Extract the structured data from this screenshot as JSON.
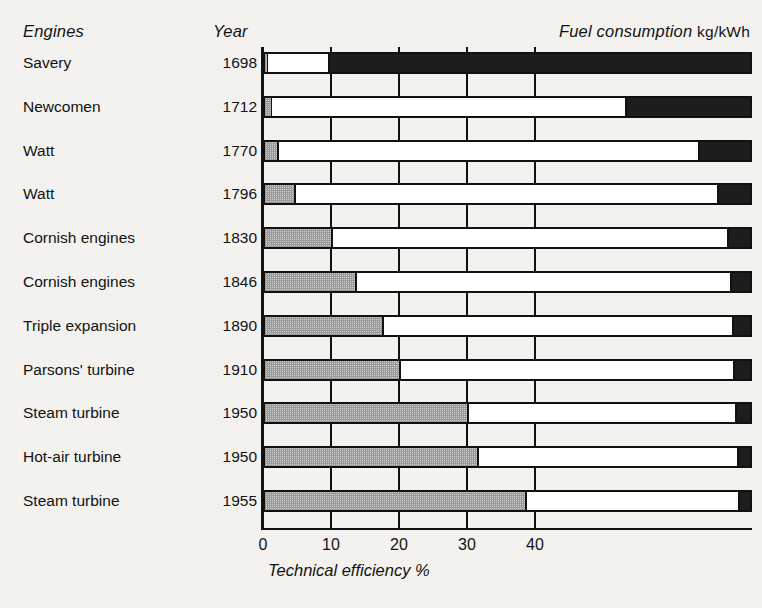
{
  "headers": {
    "engines": "Engines",
    "year": "Year",
    "fuel_consumption": "Fuel consumption",
    "fuel_consumption_unit": "kg/kWh"
  },
  "axis": {
    "title": "Technical efficiency %",
    "ticks": [
      "0",
      "10",
      "20",
      "30",
      "40"
    ]
  },
  "chart_data": {
    "type": "bar",
    "orientation": "horizontal",
    "stacked": true,
    "title": "",
    "xlabel": "Technical efficiency %",
    "ylabel": "Engines",
    "xlim": [
      0,
      40
    ],
    "tick_values": [
      0,
      10,
      20,
      30,
      40
    ],
    "tick_labels": [
      "0",
      "10",
      "20",
      "30",
      "40"
    ],
    "grid": true,
    "legend": [],
    "right_header": "Fuel consumption kg/kWh",
    "categories": [
      "Savery",
      "Newcomen",
      "Watt",
      "Watt",
      "Cornish engines",
      "Cornish engines",
      "Triple expansion",
      "Parsons' turbine",
      "Steam turbine",
      "Hot-air turbine",
      "Steam turbine"
    ],
    "years": [
      1698,
      1712,
      1770,
      1796,
      1830,
      1846,
      1890,
      1910,
      1950,
      1950,
      1955
    ],
    "series": [
      {
        "name": "Technical efficiency %",
        "fill": "hatched-grey",
        "values": [
          0.5,
          1.0,
          2.0,
          4.5,
          10.0,
          13.5,
          17.5,
          20.0,
          30.0,
          31.5,
          38.5
        ]
      },
      {
        "name": "Fuel consumption kg/kWh",
        "fill": "black",
        "values": [
          8.0,
          2.8,
          1.6,
          0.85,
          0.45,
          0.36,
          0.32,
          0.3,
          0.25,
          0.23,
          0.2
        ]
      }
    ],
    "fuel_bar_start_fraction": [
      0.138,
      0.744,
      0.894,
      0.932,
      0.953,
      0.96,
      0.963,
      0.966,
      0.97,
      0.973,
      0.976
    ]
  },
  "rows": [
    {
      "label": "Savery",
      "year": "1698",
      "efficiency": 0.5,
      "fuel_start_frac": 0.138
    },
    {
      "label": "Newcomen",
      "year": "1712",
      "efficiency": 1.0,
      "fuel_start_frac": 0.744
    },
    {
      "label": "Watt",
      "year": "1770",
      "efficiency": 2.0,
      "fuel_start_frac": 0.894
    },
    {
      "label": "Watt",
      "year": "1796",
      "efficiency": 4.5,
      "fuel_start_frac": 0.932
    },
    {
      "label": "Cornish engines",
      "year": "1830",
      "efficiency": 10.0,
      "fuel_start_frac": 0.953
    },
    {
      "label": "Cornish engines",
      "year": "1846",
      "efficiency": 13.5,
      "fuel_start_frac": 0.96
    },
    {
      "label": "Triple expansion",
      "year": "1890",
      "efficiency": 17.5,
      "fuel_start_frac": 0.963
    },
    {
      "label": "Parsons' turbine",
      "year": "1910",
      "efficiency": 20.0,
      "fuel_start_frac": 0.966
    },
    {
      "label": "Steam turbine",
      "year": "1950",
      "efficiency": 30.0,
      "fuel_start_frac": 0.97
    },
    {
      "label": "Hot-air turbine",
      "year": "1950",
      "efficiency": 31.5,
      "fuel_start_frac": 0.973
    },
    {
      "label": "Steam turbine",
      "year": "1955",
      "efficiency": 38.5,
      "fuel_start_frac": 0.976
    }
  ],
  "layout": {
    "plot_left": 263,
    "plot_top": 47,
    "plot_width": 489,
    "plot_height": 483,
    "row_pitch": 43.8,
    "first_bar_top": 5,
    "bar_height": 22,
    "px_per_percent": 6.8
  },
  "colors": {
    "ink": "#111111",
    "paper": "#f3f2ef",
    "efficiency_fill": "#cfcfcf",
    "fuel_fill": "#1d1d1d"
  }
}
